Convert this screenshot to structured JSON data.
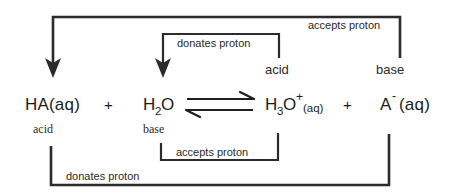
{
  "diagram": {
    "type": "acid-base-conjugate-pair-diagram",
    "equation": {
      "reactants": [
        {
          "id": "ha",
          "formula": "HA",
          "state": "(aq)",
          "role_label": "acid",
          "role_position": "below"
        },
        {
          "id": "water",
          "formula": "H",
          "subscript": "2",
          "formula_tail": "O",
          "state": "",
          "role_label": "base",
          "role_position": "below"
        }
      ],
      "products": [
        {
          "id": "hydronium",
          "formula": "H",
          "subscript": "3",
          "formula_tail": "O",
          "superscript": "+",
          "state": "(aq)",
          "role_label": "acid",
          "role_position": "above"
        },
        {
          "id": "conjugate-base",
          "formula": "A",
          "superscript": "-",
          "state": "(aq)",
          "role_label": "base",
          "role_position": "above"
        }
      ],
      "plus_sign": "+",
      "arrow_type": "equilibrium"
    },
    "text": {
      "ha_formula": "HA",
      "ha_state": "(aq)",
      "water_h": "H",
      "water_sub": "2",
      "water_o": "O",
      "hydronium_h": "H",
      "hydronium_sub": "3",
      "hydronium_o": "O",
      "hydronium_sup": "+",
      "hydronium_state": "(aq)",
      "conjugate_a": "A",
      "conjugate_sup": "-",
      "conjugate_state": "(aq)",
      "plus_left": "+",
      "plus_right": "+",
      "label_acid_left": "acid",
      "label_base_left": "base",
      "label_acid_right": "acid",
      "label_base_right": "base"
    },
    "annotations": [
      {
        "id": "outer-top",
        "label": "accepts proton",
        "from": "conjugate-base",
        "to": "ha",
        "direction": "right-to-left",
        "position": "top-outer",
        "has_arrowhead": true
      },
      {
        "id": "inner-top",
        "label": "donates proton",
        "from": "hydronium",
        "to": "water",
        "direction": "right-to-left",
        "position": "top-inner",
        "has_arrowhead": true
      },
      {
        "id": "inner-bottom",
        "label": "accepts proton",
        "from": "water",
        "to": "hydronium",
        "direction": "left-to-right",
        "position": "bottom-inner",
        "has_arrowhead": false
      },
      {
        "id": "outer-bottom",
        "label": "donates proton",
        "from": "ha",
        "to": "conjugate-base",
        "direction": "left-to-right",
        "position": "bottom-outer",
        "has_arrowhead": false
      }
    ],
    "colors": {
      "background": "#ffffff",
      "stroke": "#2b2b2b",
      "text": "#1c1c1c",
      "label_text": "#2a2a2a"
    }
  }
}
